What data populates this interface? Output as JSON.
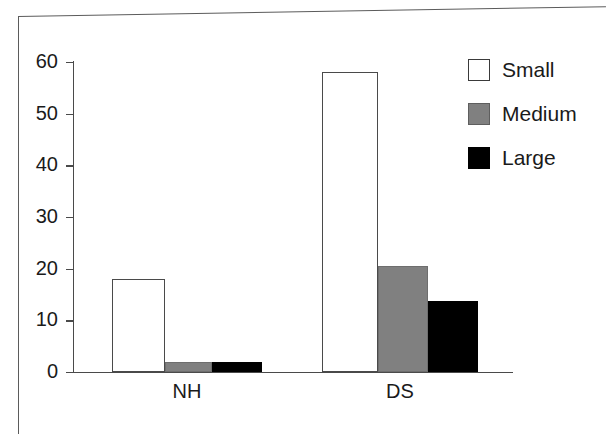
{
  "chart_data": {
    "type": "bar",
    "title": "",
    "subtitle": "",
    "xlabel": "",
    "ylabel": "",
    "categories": [
      "NH",
      "DS"
    ],
    "series": [
      {
        "name": "Small",
        "color": "#ffffff",
        "values": [
          18,
          58
        ]
      },
      {
        "name": "Medium",
        "color": "#808080",
        "values": [
          2,
          20.5
        ]
      },
      {
        "name": "Large",
        "color": "#000000",
        "values": [
          2,
          13.8
        ]
      }
    ],
    "ylim": [
      0,
      60
    ],
    "ytick_labels": [
      "60",
      "50",
      "40",
      "30",
      "20",
      "10",
      "0"
    ],
    "ytick_values": [
      60,
      50,
      40,
      30,
      20,
      10,
      0
    ],
    "grid": false,
    "legend_position": "top-right",
    "legend_entries": [
      {
        "label": "Small",
        "swatch": "white-square-outline"
      },
      {
        "label": "Medium",
        "swatch": "gray-square"
      },
      {
        "label": "Large",
        "swatch": "black-square"
      }
    ]
  },
  "axis": {
    "y_line_color": "#4a4a4a",
    "x_line_color": "#4a4a4a"
  },
  "frame": {
    "border_color": "#5b5b5b"
  }
}
